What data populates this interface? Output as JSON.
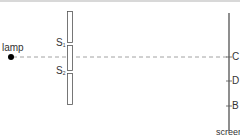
{
  "diagram": {
    "labels": {
      "lamp": "lamp",
      "slit1": "S",
      "slit1_sub": "1",
      "slit2": "S",
      "slit2_sub": "2",
      "point_c": "C",
      "point_d": "D",
      "point_b": "B",
      "screen": "screen"
    },
    "colors": {
      "line": "#555555",
      "dashed": "#8a8a8a",
      "lamp": "#000000",
      "text": "#333333"
    }
  }
}
